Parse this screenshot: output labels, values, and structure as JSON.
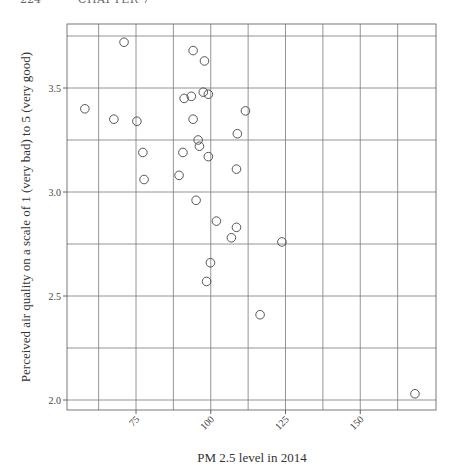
{
  "page_header": {
    "page_number": "224",
    "chapter": "CHAPTER 7"
  },
  "chart_data": {
    "type": "scatter",
    "title": "",
    "xlabel": "PM 2.5 level in 2014",
    "ylabel": "Perceived air quality on a scale of 1 (very bad) to 5 (very good)",
    "xlim": [
      52,
      176
    ],
    "ylim": [
      1.95,
      3.77
    ],
    "x_ticks": [
      75,
      100,
      125,
      150
    ],
    "x_tick_labels": [
      "75",
      "100",
      "125",
      "150"
    ],
    "y_ticks": [
      2.0,
      2.5,
      3.0,
      3.5
    ],
    "y_tick_labels": [
      "2.0",
      "2.5",
      "3.0",
      "3.5"
    ],
    "x_grid": [
      62.5,
      75,
      87.5,
      100,
      112.5,
      125,
      137.5,
      150,
      162.5
    ],
    "y_grid": [
      2.0,
      2.25,
      2.5,
      2.75,
      3.0,
      3.25,
      3.5,
      3.75
    ],
    "grid": true,
    "legend": null,
    "marker": "open-circle",
    "points": [
      {
        "x": 57.9,
        "y": 3.4
      },
      {
        "x": 67.6,
        "y": 3.35
      },
      {
        "x": 71.0,
        "y": 3.72
      },
      {
        "x": 75.3,
        "y": 3.34
      },
      {
        "x": 77.3,
        "y": 3.19
      },
      {
        "x": 77.7,
        "y": 3.06
      },
      {
        "x": 89.4,
        "y": 3.08
      },
      {
        "x": 90.7,
        "y": 3.19
      },
      {
        "x": 91.1,
        "y": 3.45
      },
      {
        "x": 93.5,
        "y": 3.46
      },
      {
        "x": 94.1,
        "y": 3.68
      },
      {
        "x": 94.1,
        "y": 3.35
      },
      {
        "x": 95.1,
        "y": 2.96
      },
      {
        "x": 95.8,
        "y": 3.25
      },
      {
        "x": 96.2,
        "y": 3.22
      },
      {
        "x": 97.5,
        "y": 3.48
      },
      {
        "x": 97.9,
        "y": 3.63
      },
      {
        "x": 99.2,
        "y": 3.47
      },
      {
        "x": 99.2,
        "y": 3.17
      },
      {
        "x": 98.6,
        "y": 2.57
      },
      {
        "x": 99.9,
        "y": 2.66
      },
      {
        "x": 101.9,
        "y": 2.86
      },
      {
        "x": 106.9,
        "y": 2.78
      },
      {
        "x": 108.6,
        "y": 2.83
      },
      {
        "x": 108.6,
        "y": 3.11
      },
      {
        "x": 108.9,
        "y": 3.28
      },
      {
        "x": 111.6,
        "y": 3.39
      },
      {
        "x": 116.5,
        "y": 2.41
      },
      {
        "x": 123.8,
        "y": 2.76
      },
      {
        "x": 168.3,
        "y": 2.03
      }
    ]
  }
}
